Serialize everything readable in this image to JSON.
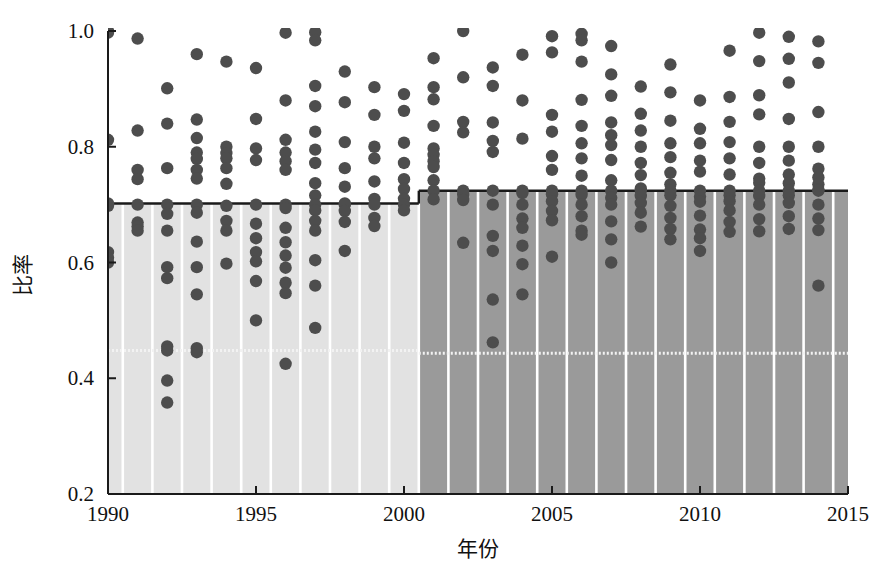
{
  "chart_data": {
    "type": "scatter",
    "title": "",
    "xlabel": "年份",
    "ylabel": "比率",
    "xlim": [
      1990,
      2015
    ],
    "ylim": [
      0.2,
      1.0
    ],
    "xticks": [
      1990,
      1995,
      2000,
      2005,
      2010,
      2015
    ],
    "xtick_labels": [
      "1990",
      "1995",
      "2000",
      "2005",
      "2010",
      "2015"
    ],
    "yticks": [
      0.2,
      0.4,
      0.6,
      0.8,
      1.0
    ],
    "ytick_labels": [
      "0.2",
      "0.4",
      "0.6",
      "0.8",
      "1.0"
    ],
    "grid": false,
    "legend": "none",
    "dot_color": "#4d4d4d",
    "band_light_color": "#e2e2e2",
    "band_dark_color": "#9a9a9a",
    "band_separator_color": "#ffffff",
    "step_line_color": "#1a1a1a",
    "dotted_line_color": "#f2f2f2",
    "annotations": {
      "step_segments": [
        {
          "x_start": 1990,
          "x_end": 2000.5,
          "y": 0.702,
          "style": "solid"
        },
        {
          "x_start": 2000.5,
          "x_end": 2015,
          "y": 0.724,
          "style": "solid"
        }
      ],
      "dotted_segments": [
        {
          "x_start": 1990,
          "x_end": 2000.5,
          "y": 0.448,
          "style": "dotted"
        },
        {
          "x_start": 2000.5,
          "x_end": 2015,
          "y": 0.443,
          "style": "dotted"
        }
      ],
      "shaded_bands": [
        {
          "x_start": 1990,
          "x_end": 2000.5,
          "y_top": 0.702,
          "shade": "light"
        },
        {
          "x_start": 2000.5,
          "x_end": 2015,
          "y_top": 0.724,
          "shade": "dark"
        }
      ]
    },
    "series": [
      {
        "name": "比率",
        "points_by_year": [
          {
            "year": 1990,
            "values": [
              1.0,
              0.997,
              0.812,
              0.702,
              0.698,
              0.618,
              0.608,
              0.6
            ]
          },
          {
            "year": 1991,
            "values": [
              0.987,
              0.828,
              0.76,
              0.744,
              0.7,
              0.669,
              0.662,
              0.655
            ]
          },
          {
            "year": 1992,
            "values": [
              0.901,
              0.84,
              0.763,
              0.7,
              0.684,
              0.655,
              0.592,
              0.573,
              0.455,
              0.448,
              0.396,
              0.358
            ]
          },
          {
            "year": 1993,
            "values": [
              0.96,
              0.847,
              0.815,
              0.79,
              0.779,
              0.76,
              0.745,
              0.7,
              0.686,
              0.636,
              0.592,
              0.545,
              0.452,
              0.445
            ]
          },
          {
            "year": 1994,
            "values": [
              0.947,
              0.8,
              0.789,
              0.78,
              0.763,
              0.736,
              0.698,
              0.672,
              0.655,
              0.598
            ]
          },
          {
            "year": 1995,
            "values": [
              0.936,
              0.848,
              0.797,
              0.777,
              0.7,
              0.667,
              0.642,
              0.618,
              0.602,
              0.568,
              0.5
            ]
          },
          {
            "year": 1996,
            "values": [
              0.997,
              0.88,
              0.812,
              0.79,
              0.775,
              0.76,
              0.7,
              0.694,
              0.66,
              0.635,
              0.612,
              0.591,
              0.565,
              0.547,
              0.425
            ]
          },
          {
            "year": 1997,
            "values": [
              0.998,
              0.984,
              0.905,
              0.87,
              0.826,
              0.795,
              0.772,
              0.737,
              0.716,
              0.7,
              0.69,
              0.672,
              0.655,
              0.604,
              0.56,
              0.487
            ]
          },
          {
            "year": 1998,
            "values": [
              0.93,
              0.877,
              0.808,
              0.763,
              0.731,
              0.702,
              0.7,
              0.689,
              0.67,
              0.62
            ]
          },
          {
            "year": 1999,
            "values": [
              0.903,
              0.855,
              0.8,
              0.78,
              0.74,
              0.71,
              0.7,
              0.677,
              0.663
            ]
          },
          {
            "year": 2000,
            "values": [
              0.891,
              0.862,
              0.807,
              0.772,
              0.744,
              0.727,
              0.71,
              0.7,
              0.69
            ]
          },
          {
            "year": 2001,
            "values": [
              0.953,
              0.903,
              0.882,
              0.836,
              0.797,
              0.786,
              0.775,
              0.765,
              0.742,
              0.724,
              0.709
            ]
          },
          {
            "year": 2002,
            "values": [
              1.0,
              0.92,
              0.843,
              0.825,
              0.724,
              0.717,
              0.708,
              0.634
            ]
          },
          {
            "year": 2003,
            "values": [
              0.937,
              0.905,
              0.842,
              0.81,
              0.791,
              0.724,
              0.7,
              0.646,
              0.62,
              0.536,
              0.462
            ]
          },
          {
            "year": 2004,
            "values": [
              0.959,
              0.88,
              0.814,
              0.724,
              0.72,
              0.7,
              0.676,
              0.66,
              0.629,
              0.597,
              0.545
            ]
          },
          {
            "year": 2005,
            "values": [
              0.991,
              0.963,
              0.855,
              0.826,
              0.784,
              0.76,
              0.724,
              0.718,
              0.706,
              0.689,
              0.673,
              0.61
            ]
          },
          {
            "year": 2006,
            "values": [
              0.995,
              0.984,
              0.947,
              0.881,
              0.836,
              0.806,
              0.78,
              0.75,
              0.724,
              0.717,
              0.7,
              0.68,
              0.655,
              0.648
            ]
          },
          {
            "year": 2007,
            "values": [
              0.974,
              0.925,
              0.888,
              0.842,
              0.82,
              0.803,
              0.777,
              0.742,
              0.724,
              0.712,
              0.7,
              0.671,
              0.64,
              0.6
            ]
          },
          {
            "year": 2008,
            "values": [
              0.904,
              0.857,
              0.828,
              0.8,
              0.772,
              0.751,
              0.728,
              0.724,
              0.715,
              0.703,
              0.686,
              0.662
            ]
          },
          {
            "year": 2009,
            "values": [
              0.942,
              0.894,
              0.845,
              0.806,
              0.782,
              0.755,
              0.735,
              0.724,
              0.716,
              0.698,
              0.677,
              0.658,
              0.64
            ]
          },
          {
            "year": 2010,
            "values": [
              0.88,
              0.831,
              0.806,
              0.776,
              0.757,
              0.724,
              0.714,
              0.705,
              0.681,
              0.657,
              0.642,
              0.62
            ]
          },
          {
            "year": 2011,
            "values": [
              0.966,
              0.886,
              0.843,
              0.808,
              0.78,
              0.752,
              0.724,
              0.716,
              0.706,
              0.69,
              0.67,
              0.653
            ]
          },
          {
            "year": 2012,
            "values": [
              0.997,
              0.948,
              0.889,
              0.856,
              0.8,
              0.772,
              0.745,
              0.738,
              0.724,
              0.715,
              0.7,
              0.675,
              0.654
            ]
          },
          {
            "year": 2013,
            "values": [
              0.99,
              0.952,
              0.911,
              0.848,
              0.8,
              0.776,
              0.752,
              0.737,
              0.724,
              0.716,
              0.703,
              0.68,
              0.658
            ]
          },
          {
            "year": 2014,
            "values": [
              0.982,
              0.945,
              0.86,
              0.8,
              0.762,
              0.747,
              0.735,
              0.726,
              0.724,
              0.7,
              0.676,
              0.656,
              0.56
            ]
          }
        ]
      }
    ]
  }
}
